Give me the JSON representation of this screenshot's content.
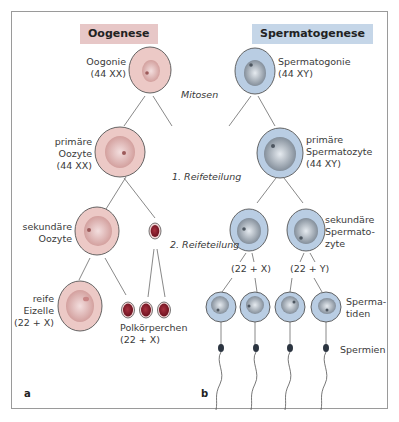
{
  "headers": {
    "oogenesis": "Oogenese",
    "spermatogenesis": "Spermatogenese"
  },
  "stages": {
    "mitosis": "Mitosen",
    "meiosis1": "1. Reifeteilung",
    "meiosis2": "2. Reifeteilung"
  },
  "oogenesis": {
    "oogonium": [
      "Oogonie",
      "(44 XX)"
    ],
    "primary_oocyte": [
      "primäre",
      "Oozyte",
      "(44 XX)"
    ],
    "secondary_oocyte": [
      "sekundäre",
      "Oozyte"
    ],
    "mature_egg": [
      "reife",
      "Eizelle",
      "(22 + X)"
    ],
    "polar_bodies": [
      "Polkörperchen",
      "(22 + X)"
    ]
  },
  "spermatogenesis": {
    "spermatogonium": [
      "Spermatogonie",
      "(44 XY)"
    ],
    "primary_spermatocyte": [
      "primäre",
      "Spermatozyte",
      "(44 XY)"
    ],
    "secondary_spermatocyte": [
      "sekundäre",
      "Spermato-",
      "zyte"
    ],
    "karyotype_x": "(22 + X)",
    "karyotype_y": "(22 + Y)",
    "spermatids": [
      "Sperma-",
      "tiden"
    ],
    "sperm": "Spermien"
  },
  "panels": {
    "a": "a",
    "b": "b"
  },
  "colors": {
    "oo_cell": "#ecc9c6",
    "oo_nucleus": "#d9a7a4",
    "polar_body": "#8e1f2e",
    "sp_cell": "#b9cde3",
    "sp_nucleus": "#8f9aa6",
    "outline": "#555555",
    "line": "#777777"
  }
}
